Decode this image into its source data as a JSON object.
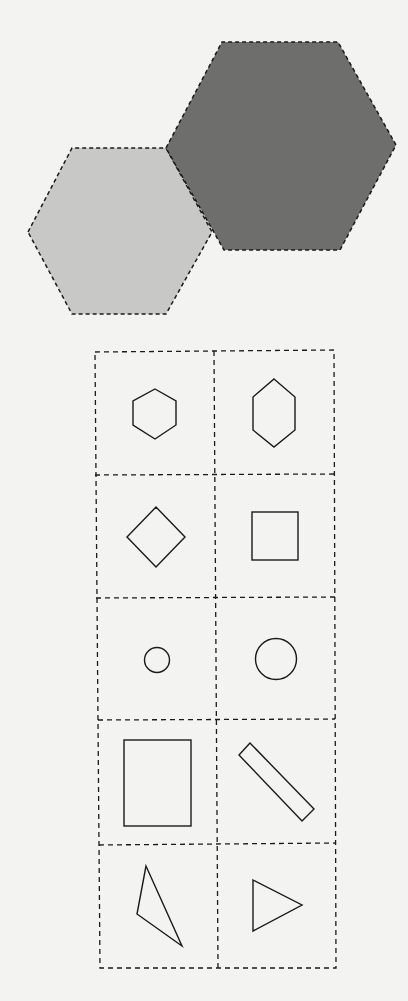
{
  "colors": {
    "background": "#f3f3f1",
    "light_hexagon_fill": "#c8c8c6",
    "dark_hexagon_fill": "#6e6e6c",
    "stroke": "#1a1a1a"
  },
  "top_figure": {
    "description": "Two adjacent hexagons with dashed outlines",
    "shapes": [
      {
        "name": "light-hexagon",
        "points": "28,232 72,148 166,148 212,232 166,314 72,314"
      },
      {
        "name": "dark-hexagon",
        "points": "166,148 222,42 338,42 396,145 340,250 224,250"
      }
    ]
  },
  "option_grid": {
    "rows": 5,
    "cols": 2,
    "cells": [
      {
        "row": 0,
        "col": 0,
        "shape": "regular-hexagon"
      },
      {
        "row": 0,
        "col": 1,
        "shape": "elongated-hexagon"
      },
      {
        "row": 1,
        "col": 0,
        "shape": "diamond"
      },
      {
        "row": 1,
        "col": 1,
        "shape": "square"
      },
      {
        "row": 2,
        "col": 0,
        "shape": "small-circle"
      },
      {
        "row": 2,
        "col": 1,
        "shape": "large-circle"
      },
      {
        "row": 3,
        "col": 0,
        "shape": "rectangle"
      },
      {
        "row": 3,
        "col": 1,
        "shape": "tilted-rectangle"
      },
      {
        "row": 4,
        "col": 0,
        "shape": "scalene-triangle"
      },
      {
        "row": 4,
        "col": 1,
        "shape": "right-pointing-triangle"
      }
    ]
  }
}
